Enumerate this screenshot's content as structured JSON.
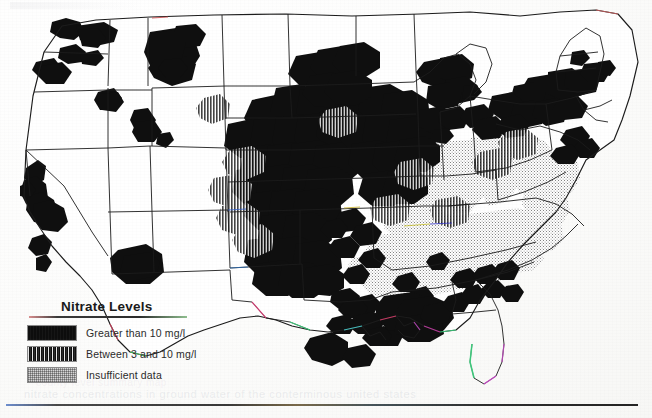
{
  "document": {
    "kind": "scanned-thematic-map",
    "region": "Continental United States",
    "faint_bleed_text": "nitrate concentrations in ground water of the conterminous united states",
    "faint_bleed_text_2": "county level summary map"
  },
  "legend": {
    "title": "Nitrate Levels",
    "items": [
      {
        "label": "Greater than 10 mg/l",
        "swatch": "solid-black",
        "swatch_class": "sw-solid"
      },
      {
        "label": "Between 3 and 10 mg/l",
        "swatch": "dark-hatch",
        "swatch_class": "sw-hatch"
      },
      {
        "label": "Insufficient data",
        "swatch": "light-stipple",
        "swatch_class": "sw-stipple"
      }
    ]
  },
  "map_data": {
    "type": "choropleth",
    "units": "mg/l",
    "classes": [
      "Greater than 10 mg/l",
      "Between 3 and 10 mg/l",
      "Insufficient data"
    ],
    "outline_color": "#1c1c1c",
    "high_fill": "#0f0f0f",
    "mid_fill": "#1b1b1b",
    "nodata_fill": "#cfcfcf",
    "background_fill": "#ffffff",
    "notable_high_regions": [
      "Central Valley, California",
      "South-central Arizona",
      "Eastern Washington / Columbia Basin",
      "Snake River Plain, Idaho",
      "Central Montana",
      "Western Nebraska and Kansas",
      "Texas Panhandle and High Plains",
      "Central Oklahoma",
      "Iowa and southern Minnesota",
      "Southern Wisconsin",
      "Central Pennsylvania and Delmarva",
      "Southern Alabama and Gulf Coast"
    ],
    "notable_nodata_regions": [
      "Illinois",
      "Indiana",
      "Ohio",
      "Kentucky",
      "Tennessee",
      "West Virginia",
      "Western Virginia",
      "Northern Georgia"
    ]
  }
}
